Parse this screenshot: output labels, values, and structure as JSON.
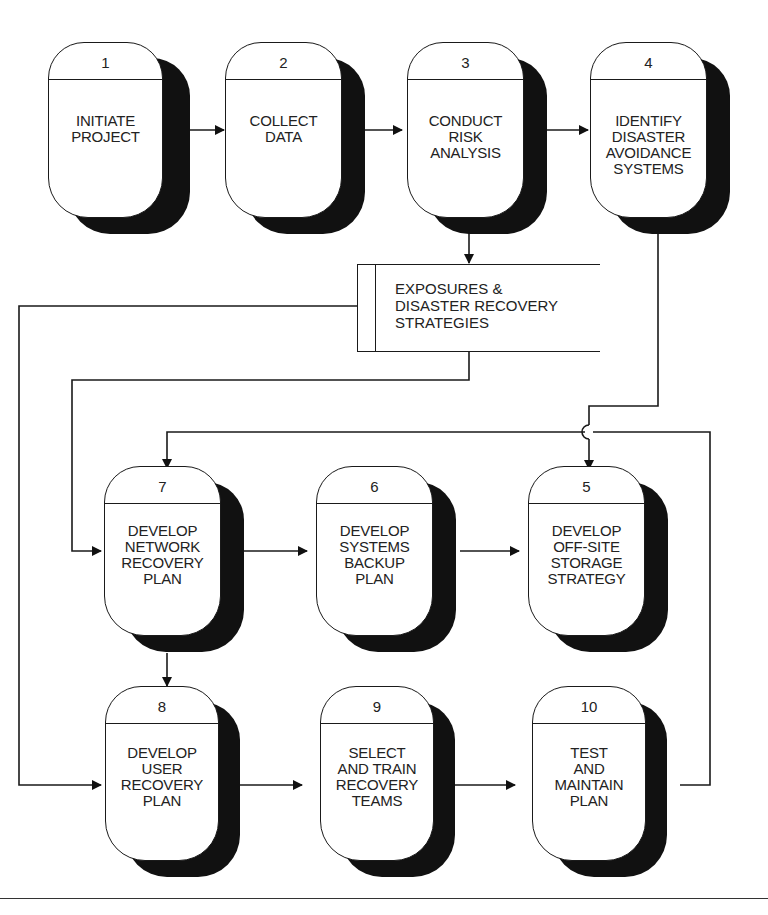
{
  "diagram": {
    "nodes": [
      {
        "id": "1",
        "number": "1",
        "label": "INITIATE\nPROJECT"
      },
      {
        "id": "2",
        "number": "2",
        "label": "COLLECT\nDATA"
      },
      {
        "id": "3",
        "number": "3",
        "label": "CONDUCT\nRISK\nANALYSIS"
      },
      {
        "id": "4",
        "number": "4",
        "label": "IDENTIFY\nDISASTER\nAVOIDANCE\nSYSTEMS"
      },
      {
        "id": "7",
        "number": "7",
        "label": "DEVELOP\nNETWORK\nRECOVERY\nPLAN"
      },
      {
        "id": "6",
        "number": "6",
        "label": "DEVELOP\nSYSTEMS\nBACKUP\nPLAN"
      },
      {
        "id": "5",
        "number": "5",
        "label": "DEVELOP\nOFF-SITE\nSTORAGE\nSTRATEGY"
      },
      {
        "id": "8",
        "number": "8",
        "label": "DEVELOP\nUSER\nRECOVERY\nPLAN"
      },
      {
        "id": "9",
        "number": "9",
        "label": "SELECT\nAND TRAIN\nRECOVERY\nTEAMS"
      },
      {
        "id": "10",
        "number": "10",
        "label": "TEST\nAND\nMAINTAIN\nPLAN"
      }
    ],
    "data_store": {
      "label": "EXPOSURES &\nDISASTER RECOVERY\nSTRATEGIES"
    },
    "edges": [
      {
        "from": "1",
        "to": "2"
      },
      {
        "from": "2",
        "to": "3"
      },
      {
        "from": "3",
        "to": "4"
      },
      {
        "from": "3",
        "to": "data_store"
      },
      {
        "from": "data_store",
        "to": "7"
      },
      {
        "from": "data_store",
        "to": "8"
      },
      {
        "from": "4",
        "to": "5"
      },
      {
        "from": "7",
        "to": "6"
      },
      {
        "from": "6",
        "to": "5"
      },
      {
        "from": "7",
        "to": "8"
      },
      {
        "from": "8",
        "to": "9"
      },
      {
        "from": "9",
        "to": "10"
      },
      {
        "from": "10",
        "to": "7"
      }
    ]
  }
}
